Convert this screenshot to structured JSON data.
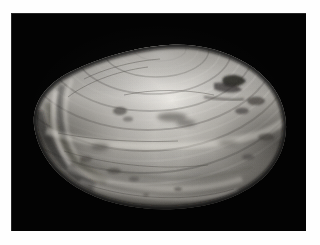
{
  "image": {
    "kind": "photograph",
    "subject": "bivalve clam shell",
    "orientation": "landscape",
    "width_px": 320,
    "height_px": 245,
    "color_mode": "grayscale"
  },
  "mount": {
    "name": "white photographic mount border",
    "color": "#fefefe",
    "inset_left_px": 11,
    "inset_top_px": 13,
    "inset_right_px": 14,
    "inset_bottom_px": 14
  },
  "field": {
    "name": "black photographic background",
    "color": "#030303",
    "x_px": 11,
    "y_px": 13,
    "width_px": 295,
    "height_px": 218
  },
  "subject": {
    "name": "clam shell valve, exterior view",
    "bounds": {
      "x_px": 28,
      "y_px": 39,
      "width_px": 262,
      "height_px": 172
    },
    "umbo_x_px": 160,
    "umbo_y_px": 43,
    "surface_tone_light": "#e4e2dd",
    "surface_tone_mid": "#b9b7b1",
    "surface_tone_shadow": "#6c6a66",
    "surface_tone_deep_shadow": "#2e2d2b",
    "blemish_color": "#3a3633",
    "growth_ring_count": 14,
    "description": "Concentric growth rings radiate from the umbo at top centre; surface is chalky off-white with darker eroded patches."
  }
}
